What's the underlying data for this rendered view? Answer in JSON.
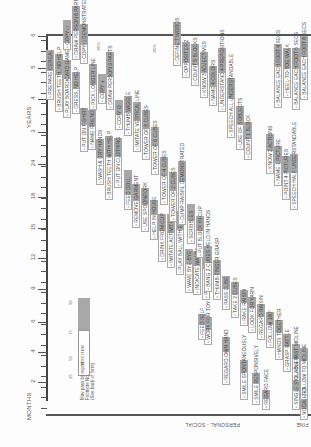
{
  "document": {
    "orientation": "rotated 90deg counterclockwise",
    "axis": {
      "months_title": "MONTHS",
      "years_title": "YEARS",
      "month_ticks": [
        {
          "label": "2",
          "y": 382
        },
        {
          "label": "4",
          "y": 352
        },
        {
          "label": "6",
          "y": 322
        },
        {
          "label": "9",
          "y": 289
        },
        {
          "label": "12",
          "y": 258
        },
        {
          "label": "15",
          "y": 228
        },
        {
          "label": "18",
          "y": 197
        },
        {
          "label": "24",
          "y": 164
        }
      ],
      "year_ticks": [
        {
          "label": "3",
          "y": 132
        },
        {
          "label": "4",
          "y": 99
        },
        {
          "label": "5",
          "y": 68
        },
        {
          "label": "6",
          "y": 36
        }
      ]
    },
    "legend": {
      "percent_labels": [
        "25",
        "50",
        "75",
        "90"
      ],
      "sample_item": "TEST ITEM",
      "note_lines": [
        "May pass by report",
        "Footnote No.",
        "(See back of form)"
      ]
    },
    "sector_labels": {
      "personal_social": "PERSONAL - SOCIAL",
      "fine_motor_partial": "FINE"
    },
    "personal_social_items": [
      {
        "label": "REGARD FACE",
        "x": 262,
        "y": 410,
        "len": 20,
        "grey": 8
      },
      {
        "label": "SMILE RESPONSIVELY",
        "x": 252,
        "y": 405,
        "len": 32,
        "grey": 10
      },
      {
        "label": "SMILE SPONTANEOUSLY",
        "x": 240,
        "y": 400,
        "len": 40,
        "grey": 12
      },
      {
        "label": "REGARD OWN HAND",
        "x": 222,
        "y": 385,
        "len": 48,
        "grey": 14
      },
      {
        "label": "WORK FOR TOY",
        "x": 204,
        "y": 345,
        "len": 28,
        "grey": 12
      },
      {
        "label": "FEED SELF",
        "x": 198,
        "y": 340,
        "len": 26,
        "grey": 10
      },
      {
        "label": "PLAY PAT-A-CAKE",
        "x": 202,
        "y": 300,
        "len": 44,
        "grey": 12
      },
      {
        "label": "INDICATE WANTS",
        "x": 193,
        "y": 295,
        "len": 44,
        "grey": 14
      },
      {
        "label": "WAVE BYE-BYE",
        "x": 185,
        "y": 293,
        "len": 44,
        "grey": 14
      },
      {
        "label": "PLAY BALL WITH EXAMINER",
        "x": 176,
        "y": 275,
        "len": 64,
        "grey": 18
      },
      {
        "label": "IMITATE ACTIVITIES",
        "x": 167,
        "y": 268,
        "len": 54,
        "grey": 18
      },
      {
        "label": "DRINK FROM CUP",
        "x": 158,
        "y": 262,
        "len": 48,
        "grey": 16
      },
      {
        "label": "HELP IN HOUSE",
        "x": 150,
        "y": 240,
        "len": 40,
        "grey": 14
      },
      {
        "label": "USE SPOON/FORK",
        "x": 141,
        "y": 232,
        "len": 44,
        "grey": 16
      },
      {
        "label": "REMOVE GARMENT",
        "x": 132,
        "y": 228,
        "len": 44,
        "grey": 16
      },
      {
        "label": "FEED DOLL",
        "x": 124,
        "y": 210,
        "len": 40,
        "grey": 24
      },
      {
        "label": "PUT ON CLOTHING",
        "x": 114,
        "y": 188,
        "len": 50,
        "grey": 18
      },
      {
        "label": "BRUSH TEETH WITH HELP",
        "x": 105,
        "y": 200,
        "len": 64,
        "grey": 20
      },
      {
        "label": "WASH & DRY HANDS",
        "x": 96,
        "y": 185,
        "len": 46,
        "grey": 18
      },
      {
        "label": "NAME FRIEND",
        "x": 88,
        "y": 150,
        "len": 40,
        "grey": 16
      },
      {
        "label": "PUT ON T-SHIRT",
        "x": 80,
        "y": 152,
        "len": 44,
        "grey": 16
      },
      {
        "label": "DRESS, NO HELP",
        "x": 72,
        "y": 114,
        "len": 42,
        "grey": 16
      },
      {
        "label": "PLAY BOARD/CARD GAMES",
        "x": 63,
        "y": 118,
        "len": 58,
        "grey": 18
      },
      {
        "label": "BRUSH TEETH, NO HELP",
        "x": 55,
        "y": 112,
        "len": 58,
        "grey": 20
      },
      {
        "label": "PREPARE CEREAL",
        "x": 46,
        "y": 100,
        "len": 50,
        "grey": 20
      }
    ],
    "fine_motor_items": [
      {
        "label": "FOLLOW TO MIDLINE",
        "x": 300,
        "y": 400,
        "len": 52,
        "grey": 12
      },
      {
        "label": "FOLLOW PAST MIDLINE",
        "x": 292,
        "y": 388,
        "len": 44,
        "grey": 14
      },
      {
        "label": "GRASP RATTLE",
        "x": 283,
        "y": 372,
        "len": 38,
        "grey": 12
      },
      {
        "label": "HANDS TOGETHER",
        "x": 275,
        "y": 360,
        "len": 40,
        "grey": 12
      },
      {
        "label": "FOLLOW 180°",
        "x": 266,
        "y": 348,
        "len": 36,
        "grey": 12
      },
      {
        "label": "REGARD RAISIN",
        "x": 257,
        "y": 340,
        "len": 36,
        "grey": 12
      },
      {
        "label": "LOOK FOR YARN",
        "x": 248,
        "y": 333,
        "len": 36,
        "grey": 10
      },
      {
        "label": "RAKE RAISIN",
        "x": 240,
        "y": 326,
        "len": 36,
        "grey": 12
      },
      {
        "label": "TAKE 2 CUBES",
        "x": 231,
        "y": 318,
        "len": 36,
        "grey": 12
      },
      {
        "label": "PASS CUBE",
        "x": 222,
        "y": 310,
        "len": 34,
        "grey": 12
      },
      {
        "label": "THUMB-FINGER GRASP",
        "x": 213,
        "y": 300,
        "len": 40,
        "grey": 14
      },
      {
        "label": "BANG 2 CUBES HELD IN HANDS",
        "x": 204,
        "y": 292,
        "len": 46,
        "grey": 16
      },
      {
        "label": "PUT BLOCK IN CUP",
        "x": 196,
        "y": 258,
        "len": 42,
        "grey": 14
      },
      {
        "label": "SCRIBBLES",
        "x": 187,
        "y": 244,
        "len": 40,
        "grey": 16
      },
      {
        "label": "DUMP RAISIN, DEMONSTRATED",
        "x": 178,
        "y": 225,
        "len": 64,
        "grey": 20
      },
      {
        "label": "TOWER OF 2 CUBES",
        "x": 169,
        "y": 222,
        "len": 50,
        "grey": 18
      },
      {
        "label": "TOWER OF 4 CUBES",
        "x": 160,
        "y": 205,
        "len": 48,
        "grey": 18
      },
      {
        "label": "TOWER OF 6 CUBES",
        "x": 151,
        "y": 175,
        "len": 48,
        "grey": 18
      },
      {
        "label": "TOWER OF 8 CUBES",
        "x": 142,
        "y": 160,
        "len": 50,
        "grey": 18
      },
      {
        "label": "IMITATE VERTICAL LINE",
        "x": 133,
        "y": 152,
        "len": 50,
        "grey": 18
      },
      {
        "label": "THUMB WIGGLE",
        "x": 124,
        "y": 136,
        "len": 40,
        "grey": 16
      },
      {
        "label": "COPY O",
        "x": 115,
        "y": 130,
        "len": 30,
        "grey": 14
      },
      {
        "label": "DRAW PERSON 3 PARTS",
        "x": 106,
        "y": 110,
        "len": 58,
        "grey": 24
      },
      {
        "label": "COPY +",
        "x": 98,
        "y": 104,
        "len": 30,
        "grey": 18
      },
      {
        "label": "PICK LONGER LINE",
        "x": 89,
        "y": 110,
        "len": 46,
        "grey": 20
      },
      {
        "label": "COPY □ DEMONSTRATED",
        "x": 80,
        "y": 64,
        "len": 40,
        "grey": 20
      },
      {
        "label": "DRAW PERSON 6 PARTS",
        "x": 72,
        "y": 60,
        "len": 54,
        "grey": 24
      },
      {
        "label": "COPY □",
        "x": 63,
        "y": 50,
        "len": 30,
        "grey": 22
      }
    ],
    "language_items": [
      {
        "label": "VOCALIZES",
        "x": 300,
        "y": 420,
        "len": 20,
        "grey": 8
      },
      {
        "label": "SINGLE SYLLABLES",
        "x": 292,
        "y": 410,
        "len": 30,
        "grey": 10
      },
      {
        "label": "SPEECH HALF UNDERSTANDABLE",
        "x": 290,
        "y": 210,
        "len": 56,
        "grey": 18
      },
      {
        "label": "POINT 4 PICTURES",
        "x": 282,
        "y": 200,
        "len": 44,
        "grey": 16
      },
      {
        "label": "NAME 1 PICTURE",
        "x": 274,
        "y": 186,
        "len": 40,
        "grey": 16
      },
      {
        "label": "KNOW 2 ACTIONS",
        "x": 266,
        "y": 174,
        "len": 40,
        "grey": 16
      },
      {
        "label": "SPEECH ALL UNDERSTANDABLE",
        "x": 227,
        "y": 138,
        "len": 60,
        "grey": 20
      },
      {
        "label": "UNDERSTAND 4 PREPOSITIONS",
        "x": 218,
        "y": 112,
        "len": 64,
        "grey": 24
      },
      {
        "label": "NAME 4 COLORS",
        "x": 209,
        "y": 106,
        "len": 40,
        "grey": 20
      },
      {
        "label": "USE OF 3 OBJECTS",
        "x": 236,
        "y": 150,
        "len": 44,
        "grey": 18
      },
      {
        "label": "COUNT 1 BLOCK",
        "x": 244,
        "y": 160,
        "len": 38,
        "grey": 16
      },
      {
        "label": "KNOW 3 ADJECTIVES",
        "x": 200,
        "y": 98,
        "len": 46,
        "grey": 20
      },
      {
        "label": "COUNT 5 BLOCKS",
        "x": 191,
        "y": 86,
        "len": 42,
        "grey": 20
      },
      {
        "label": "OPPOSITES 2",
        "x": 182,
        "y": 78,
        "len": 36,
        "grey": 20
      },
      {
        "label": "DEFINE 7 WORDS",
        "x": 173,
        "y": 66,
        "len": 44,
        "grey": 22
      }
    ],
    "gross_motor_items": [
      {
        "label": "BALANCE EACH FOOT 6 SECS",
        "x": 300,
        "y": 100,
        "len": 64,
        "grey": 20
      },
      {
        "label": "BALANCE EACH FOOT 5 SECS",
        "x": 292,
        "y": 110,
        "len": 62,
        "grey": 20
      },
      {
        "label": "HEEL-TO-TOE WALK",
        "x": 283,
        "y": 98,
        "len": 50,
        "grey": 20
      },
      {
        "label": "BALANCE EACH FOOT 4 SECS",
        "x": 274,
        "y": 108,
        "len": 64,
        "grey": 22
      }
    ],
    "percent_marks": [
      "85%",
      "85%",
      "85%"
    ]
  }
}
